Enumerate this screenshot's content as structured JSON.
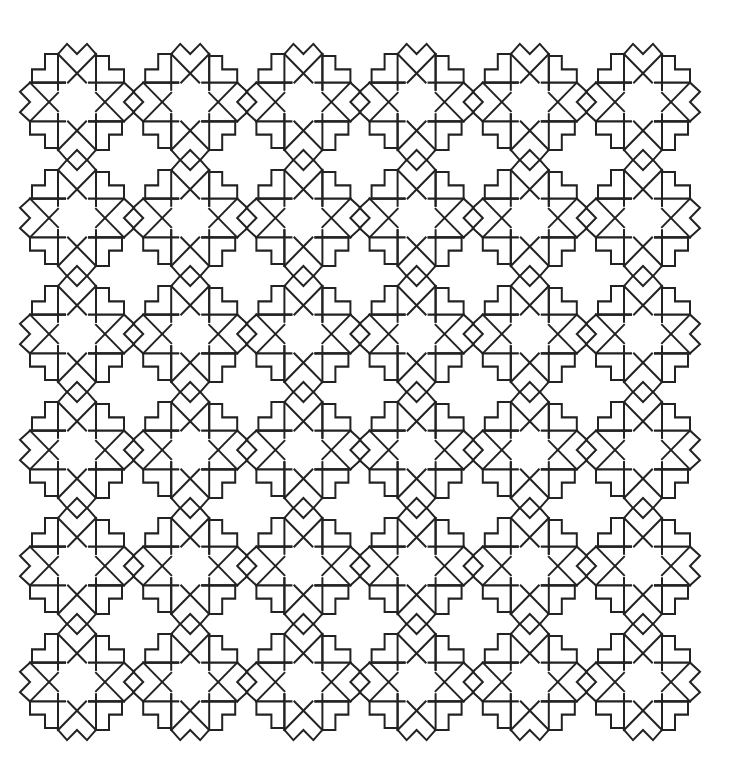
{
  "pattern": {
    "description": "Geometric line-art tiling of interlaced star rosettes",
    "rows": 6,
    "columns": 6,
    "origin": {
      "x": 77,
      "y": 102
    },
    "step": {
      "x": 113.2,
      "y": 116
    },
    "tile_scale_y": 1.02,
    "colors": {
      "background": "#ffffff",
      "line": "#222222"
    },
    "line_width": 2
  }
}
